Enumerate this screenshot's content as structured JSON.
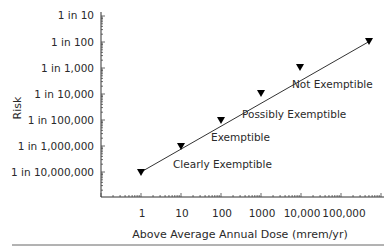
{
  "chart_data": {
    "type": "line",
    "title": "",
    "xlabel": "Above Average Annual Dose (mrem/yr)",
    "ylabel": "Risk",
    "x_scale": "log",
    "y_scale": "log",
    "x_ticks": [
      "1",
      "10",
      "100",
      "1000",
      "10,000",
      "100,000"
    ],
    "y_ticks": [
      "1 in 10",
      "1 in 100",
      "1 in 1,000",
      "1 in 10,000",
      "1 in 100,000",
      "1 in 1,000,000",
      "1 in 10,000,000"
    ],
    "series": [
      {
        "name": "Risk vs Dose",
        "marker": "down-triangle",
        "x": [
          1,
          10,
          100,
          1000,
          10000,
          100000
        ],
        "y_label": [
          "1 in 10,000,000",
          "1 in 1,000,000",
          "1 in 100,000",
          "1 in 10,000",
          "1 in 1,000",
          "1 in 100"
        ],
        "y": [
          1e-07,
          1e-06,
          1e-05,
          0.0001,
          0.001,
          0.01
        ]
      }
    ],
    "annotations": [
      "Clearly Exemptible",
      "Exemptible",
      "Possibly Exemptible",
      "Not Exemptible"
    ],
    "grid": false,
    "legend": "none"
  },
  "labels": {
    "ylabel": "Risk",
    "xlabel": "Above Average Annual Dose (mrem/yr)",
    "yticks": [
      "1 in 10",
      "1 in 100",
      "1 in 1,000",
      "1 in 10,000",
      "1 in 100,000",
      "1 in 1,000,000",
      "1 in 10,000,000"
    ],
    "xticks": [
      "1",
      "10",
      "100",
      "1000",
      "10,000",
      "100,000"
    ],
    "annotations": {
      "clearly": "Clearly Exemptible",
      "exemptible": "Exemptible",
      "possibly": "Possibly Exemptible",
      "not": "Not Exemptible"
    }
  }
}
